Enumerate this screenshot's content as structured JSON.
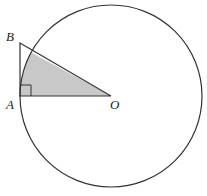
{
  "diagram": {
    "type": "geometry",
    "colors": {
      "stroke": "#333333",
      "shade": "#c8c8c8",
      "background": "#ffffff"
    },
    "labels": {
      "B": "B",
      "A": "A",
      "O": "O"
    },
    "points": {
      "O": [
        111,
        96
      ],
      "A": [
        20,
        96
      ],
      "B": [
        20,
        43
      ]
    },
    "circle": {
      "center": "O",
      "radius": 91
    },
    "right_angle_at": "A",
    "shaded_region": "sector AOB inside circle"
  }
}
